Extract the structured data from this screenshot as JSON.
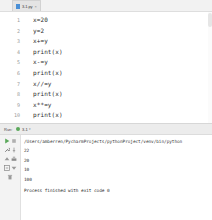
{
  "editor": {
    "tab": {
      "label": "3-1.py",
      "file_icon": "python-file-icon",
      "close_icon": "×"
    },
    "lines": [
      {
        "number": "1",
        "text": "x=20"
      },
      {
        "number": "2",
        "text": "y=2"
      },
      {
        "number": "3",
        "text": "x+=y"
      },
      {
        "number": "4",
        "text": "print(x)"
      },
      {
        "number": "5",
        "text": "x-=y"
      },
      {
        "number": "6",
        "text": "print(x)"
      },
      {
        "number": "7",
        "text": "x//=y"
      },
      {
        "number": "8",
        "text": "print(x)"
      },
      {
        "number": "9",
        "text": "x**=y"
      },
      {
        "number": "10",
        "text": "print(x)"
      }
    ]
  },
  "run_panel": {
    "header_label": "Run:",
    "config_name": "3-1",
    "config_caret": "▾",
    "toolbar": [
      {
        "name": "rerun-button",
        "icon": "play-icon"
      },
      {
        "name": "stop-button",
        "icon": "stop-icon"
      },
      {
        "name": "settings-button",
        "icon": "wrench-icon"
      },
      {
        "name": "pin-button",
        "icon": "pin-icon"
      },
      {
        "name": "scroll-up-button",
        "icon": "arrow-up-icon"
      },
      {
        "name": "scroll-down-button",
        "icon": "arrow-down-icon"
      },
      {
        "name": "print-button",
        "icon": "printer-icon"
      },
      {
        "name": "soft-wrap-button",
        "icon": "wrap-icon"
      },
      {
        "name": "clear-all-button",
        "icon": "trash-icon"
      }
    ],
    "console": {
      "interpreter_path": "/Users/amberren/PycharmProjects/pythonProject/venv/bin/python",
      "outputs": [
        "22",
        "20",
        "10",
        "100"
      ],
      "status": "Process finished with exit code 0"
    }
  },
  "colors": {
    "accent_green": "#5aa85a",
    "tab_blue": "#4a8fd6",
    "panel_bg": "#ececec",
    "editor_bg": "#ffffff",
    "code_text": "#2b2b2b",
    "gutter_text": "#999999"
  }
}
